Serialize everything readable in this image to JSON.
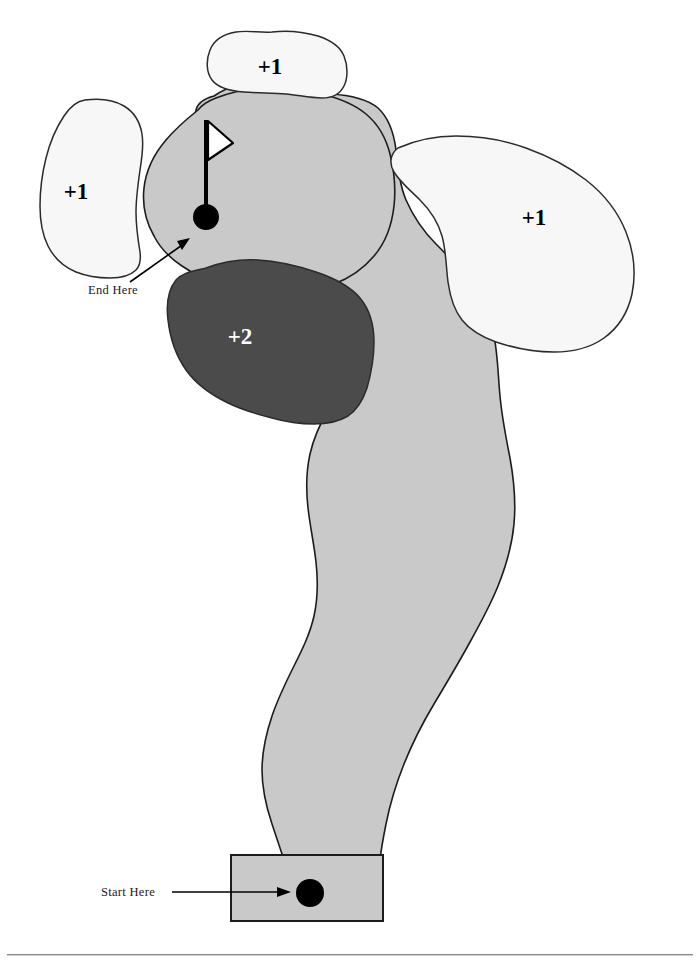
{
  "page": {
    "background_color": "#ffffff",
    "width": 700,
    "height": 966
  },
  "colors": {
    "fairway_fill": "#c9c9c9",
    "fairway_stroke": "#1c1c1c",
    "bunker_fill": "#f7f7f7",
    "bunker_stroke": "#2b2b2b",
    "hazard_fill": "#4b4b4b",
    "hazard_stroke": "#2b2b2b",
    "tee_fill": "#c9c9c9",
    "tee_stroke": "#1c1c1c",
    "marker_fill": "#000000",
    "flag_fill": "#ffffff",
    "pole_color": "#000000",
    "footer_rule": "#8a8a8a"
  },
  "hazards": [
    {
      "id": "bunker-top",
      "label": "+1",
      "kind": "bunker",
      "penalty": 1,
      "label_x": 270,
      "label_y": 74
    },
    {
      "id": "bunker-left",
      "label": "+1",
      "kind": "bunker",
      "penalty": 1,
      "label_x": 76,
      "label_y": 199
    },
    {
      "id": "bunker-right",
      "label": "+1",
      "kind": "bunker",
      "penalty": 1,
      "label_x": 534,
      "label_y": 225
    },
    {
      "id": "water-center",
      "label": "+2",
      "kind": "water",
      "penalty": 2,
      "label_x": 240,
      "label_y": 344
    }
  ],
  "annotations": [
    {
      "id": "end-here",
      "label": "End Here",
      "x": 88,
      "y": 294
    },
    {
      "id": "start-here",
      "label": "Start Here",
      "x": 101,
      "y": 896
    }
  ],
  "markers": {
    "hole": {
      "label": "hole",
      "cx": 206,
      "cy": 217,
      "r": 13
    },
    "tee_ball": {
      "label": "tee ball",
      "cx": 310,
      "cy": 893,
      "r": 14
    }
  },
  "flagstick": {
    "label": "flagstick",
    "pole_x": 206,
    "pole_top_y": 120,
    "pole_bottom_y": 215,
    "flag_points": "207,121 232,143 207,160"
  },
  "tee_box": {
    "label": "tee box",
    "x": 231,
    "y": 855,
    "width": 152,
    "height": 66
  }
}
